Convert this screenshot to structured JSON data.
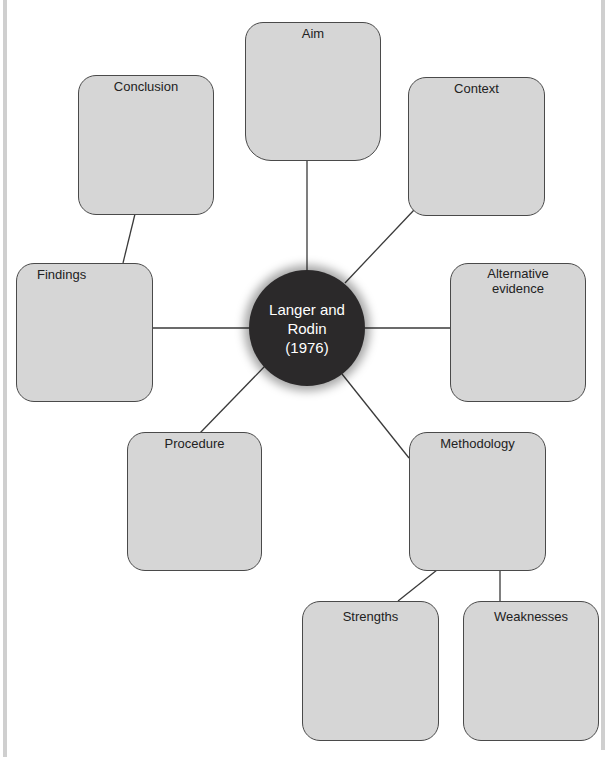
{
  "diagram": {
    "center": {
      "line1": "Langer and",
      "line2": "Rodin",
      "line3": "(1976)",
      "color": "#2b292a"
    },
    "nodes": [
      {
        "id": "aim",
        "label": "Aim"
      },
      {
        "id": "conclusion",
        "label": "Conclusion"
      },
      {
        "id": "context",
        "label": "Context"
      },
      {
        "id": "findings",
        "label": "Findings"
      },
      {
        "id": "alternative-evidence",
        "label_line1": "Alternative",
        "label_line2": "evidence"
      },
      {
        "id": "procedure",
        "label": "Procedure"
      },
      {
        "id": "methodology",
        "label": "Methodology"
      },
      {
        "id": "strengths",
        "label": "Strengths"
      },
      {
        "id": "weaknesses",
        "label": "Weaknesses"
      }
    ],
    "box_fill": "#d6d6d6",
    "box_stroke": "#4a4a4a"
  }
}
